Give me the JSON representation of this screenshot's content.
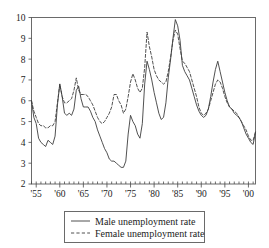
{
  "chart_data": {
    "type": "line",
    "title": "",
    "xlabel": "",
    "ylabel": "",
    "xlim": [
      1954.0,
      2001.5
    ],
    "ylim": [
      2,
      10
    ],
    "grid": false,
    "legend_position": "below-center",
    "y_ticks": [
      2,
      3,
      4,
      5,
      6,
      7,
      8,
      9,
      10
    ],
    "y_tick_labels": [
      "2",
      "3",
      "4",
      "5",
      "6",
      "7",
      "8",
      "9",
      "10"
    ],
    "x_major_ticks": [
      1955,
      1960,
      1965,
      1970,
      1975,
      1980,
      1985,
      1990,
      1995,
      2000
    ],
    "x_tick_labels": [
      "'55",
      "'60",
      "'65",
      "'70",
      "'75",
      "'80",
      "'85",
      "'90",
      "'95",
      "'00"
    ],
    "x_minor_tick_interval": 1,
    "x": [
      1954.0,
      1954.5,
      1955.0,
      1955.5,
      1956.0,
      1956.5,
      1957.0,
      1957.5,
      1958.0,
      1958.5,
      1959.0,
      1959.5,
      1960.0,
      1960.5,
      1961.0,
      1961.5,
      1962.0,
      1962.5,
      1963.0,
      1963.5,
      1964.0,
      1964.5,
      1965.0,
      1965.5,
      1966.0,
      1966.5,
      1967.0,
      1967.5,
      1968.0,
      1968.5,
      1969.0,
      1969.5,
      1970.0,
      1970.5,
      1971.0,
      1971.5,
      1972.0,
      1972.5,
      1973.0,
      1973.5,
      1974.0,
      1974.5,
      1975.0,
      1975.5,
      1976.0,
      1976.5,
      1977.0,
      1977.5,
      1978.0,
      1978.5,
      1979.0,
      1979.5,
      1980.0,
      1980.5,
      1981.0,
      1981.5,
      1982.0,
      1982.5,
      1983.0,
      1983.5,
      1984.0,
      1984.5,
      1985.0,
      1985.5,
      1986.0,
      1986.5,
      1987.0,
      1987.5,
      1988.0,
      1988.5,
      1989.0,
      1989.5,
      1990.0,
      1990.5,
      1991.0,
      1991.5,
      1992.0,
      1992.5,
      1993.0,
      1993.5,
      1994.0,
      1994.5,
      1995.0,
      1995.5,
      1996.0,
      1996.5,
      1997.0,
      1997.5,
      1998.0,
      1998.5,
      1999.0,
      1999.5,
      2000.0,
      2000.5,
      2001.0,
      2001.5
    ],
    "series": [
      {
        "name": "Male unemployment rate",
        "style": "solid",
        "color": "#3d3d3d",
        "values": [
          6.0,
          5.2,
          4.9,
          4.2,
          4.0,
          3.9,
          3.8,
          4.1,
          4.0,
          3.9,
          4.3,
          5.8,
          6.8,
          6.2,
          5.4,
          5.3,
          5.4,
          5.3,
          5.6,
          6.5,
          6.7,
          6.1,
          5.7,
          5.7,
          5.7,
          5.5,
          5.2,
          5.0,
          4.6,
          4.3,
          4.0,
          3.7,
          3.5,
          3.2,
          3.1,
          3.1,
          3.0,
          2.9,
          2.8,
          2.8,
          3.1,
          4.4,
          5.3,
          5.0,
          4.8,
          4.4,
          4.2,
          4.9,
          6.8,
          7.9,
          7.5,
          7.0,
          6.4,
          5.9,
          5.4,
          5.1,
          5.2,
          5.9,
          7.1,
          8.0,
          9.0,
          9.9,
          9.6,
          8.9,
          7.7,
          7.4,
          7.2,
          7.0,
          6.6,
          6.2,
          5.8,
          5.5,
          5.3,
          5.2,
          5.3,
          5.6,
          6.2,
          6.9,
          7.5,
          7.9,
          7.4,
          6.9,
          6.4,
          6.0,
          5.7,
          5.6,
          5.4,
          5.3,
          5.2,
          5.0,
          4.7,
          4.4,
          4.2,
          4.0,
          3.9,
          4.5
        ]
      },
      {
        "name": "Female unemployment rate",
        "style": "dashed",
        "color": "#3d3d3d",
        "values": [
          6.0,
          5.5,
          5.2,
          4.9,
          4.8,
          4.8,
          4.7,
          4.7,
          4.8,
          4.8,
          5.0,
          5.9,
          6.8,
          6.2,
          5.9,
          5.9,
          6.0,
          6.1,
          6.5,
          7.1,
          6.5,
          6.3,
          6.3,
          6.3,
          6.2,
          6.0,
          5.8,
          5.5,
          5.2,
          5.0,
          4.9,
          5.0,
          5.2,
          5.4,
          5.7,
          6.3,
          6.3,
          6.0,
          5.8,
          5.4,
          5.6,
          6.2,
          6.9,
          7.3,
          7.0,
          6.6,
          6.4,
          6.6,
          7.6,
          9.3,
          8.6,
          8.1,
          7.5,
          7.2,
          7.0,
          6.9,
          6.8,
          6.9,
          7.4,
          8.1,
          8.9,
          9.4,
          9.2,
          8.5,
          7.9,
          7.8,
          7.6,
          7.4,
          7.0,
          6.6,
          6.2,
          5.7,
          5.4,
          5.3,
          5.4,
          5.6,
          6.0,
          6.4,
          6.8,
          7.0,
          6.9,
          6.6,
          6.2,
          5.9,
          5.7,
          5.6,
          5.5,
          5.4,
          5.2,
          5.0,
          4.8,
          4.6,
          4.3,
          4.1,
          4.1,
          4.5
        ]
      }
    ]
  },
  "legend": {
    "entries": [
      {
        "label": "Male unemployment rate",
        "style": "solid"
      },
      {
        "label": "Female unemployment rate",
        "style": "dashed"
      }
    ]
  }
}
